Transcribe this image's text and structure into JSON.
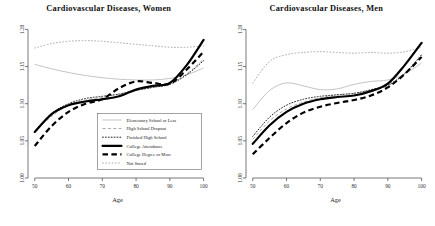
{
  "figure": {
    "panels": [
      {
        "id": "women",
        "title": "Cardiovascular Diseases, Women",
        "has_legend": true
      },
      {
        "id": "men",
        "title": "Cardiovascular Diseases, Men",
        "has_legend": false
      }
    ]
  },
  "axes": {
    "xlabel": "Age",
    "ylabel": "",
    "xticks": [
      "50",
      "60",
      "70",
      "80",
      "90",
      "100"
    ],
    "yticks": [
      "1.00",
      "1.05",
      "1.10",
      "1.15",
      "1.20"
    ],
    "xlim": [
      48,
      101
    ],
    "ylim": [
      1.0,
      1.21
    ]
  },
  "legend": {
    "items": [
      {
        "label": "Elementary School or Less",
        "style": "thin-gray-solid"
      },
      {
        "label": "High School Dropout",
        "style": "gray-dashed"
      },
      {
        "label": "Finished High School",
        "style": "black-dotted"
      },
      {
        "label": "College Attendance",
        "style": "thick-black-solid"
      },
      {
        "label": "College Degree or More",
        "style": "thick-black-dashed"
      },
      {
        "label": "Not Stated",
        "style": "faint-dotted"
      }
    ]
  },
  "chart_data": {
    "type": "line",
    "xlabel": "Age",
    "ylabel": "",
    "xlim": [
      48,
      101
    ],
    "ylim": [
      1.0,
      1.21
    ],
    "grid": false,
    "legend_position": "lower-right (women panel only)",
    "x": [
      50,
      55,
      60,
      65,
      70,
      75,
      80,
      85,
      90,
      95,
      100
    ],
    "panels": [
      {
        "name": "Cardiovascular Diseases, Women",
        "series": [
          {
            "name": "Elementary School or Less",
            "values": [
              1.153,
              1.147,
              1.142,
              1.138,
              1.135,
              1.133,
              1.132,
              1.132,
              1.134,
              1.139,
              1.148
            ]
          },
          {
            "name": "High School Dropout",
            "values": [
              1.062,
              1.083,
              1.098,
              1.105,
              1.109,
              1.113,
              1.118,
              1.122,
              1.127,
              1.14,
              1.16
            ]
          },
          {
            "name": "Finished High School",
            "values": [
              1.063,
              1.087,
              1.1,
              1.107,
              1.11,
              1.113,
              1.118,
              1.122,
              1.126,
              1.139,
              1.158
            ]
          },
          {
            "name": "College Attendance",
            "values": [
              1.062,
              1.086,
              1.098,
              1.103,
              1.106,
              1.11,
              1.119,
              1.124,
              1.128,
              1.152,
              1.186
            ]
          },
          {
            "name": "College Degree or More",
            "values": [
              1.043,
              1.07,
              1.089,
              1.1,
              1.106,
              1.121,
              1.13,
              1.128,
              1.127,
              1.146,
              1.17
            ]
          },
          {
            "name": "Not Stated",
            "values": [
              1.175,
              1.181,
              1.184,
              1.185,
              1.184,
              1.182,
              1.18,
              1.178,
              1.176,
              1.176,
              1.178
            ]
          }
        ]
      },
      {
        "name": "Cardiovascular Diseases, Men",
        "series": [
          {
            "name": "Elementary School or Less",
            "values": [
              1.092,
              1.118,
              1.128,
              1.124,
              1.119,
              1.12,
              1.126,
              1.13,
              1.132,
              1.14,
              1.155
            ]
          },
          {
            "name": "High School Dropout",
            "values": [
              1.052,
              1.077,
              1.093,
              1.102,
              1.108,
              1.112,
              1.114,
              1.118,
              1.124,
              1.14,
              1.165
            ]
          },
          {
            "name": "Finished High School",
            "values": [
              1.056,
              1.082,
              1.098,
              1.106,
              1.11,
              1.112,
              1.114,
              1.119,
              1.125,
              1.141,
              1.166
            ]
          },
          {
            "name": "College Attendance",
            "values": [
              1.046,
              1.071,
              1.089,
              1.1,
              1.106,
              1.109,
              1.111,
              1.117,
              1.127,
              1.152,
              1.182
            ]
          },
          {
            "name": "College Degree or More",
            "values": [
              1.032,
              1.054,
              1.074,
              1.088,
              1.096,
              1.101,
              1.105,
              1.111,
              1.122,
              1.14,
              1.163
            ]
          },
          {
            "name": "Not Stated",
            "values": [
              1.128,
              1.157,
              1.166,
              1.169,
              1.17,
              1.169,
              1.168,
              1.169,
              1.168,
              1.17,
              1.176
            ]
          }
        ]
      }
    ]
  }
}
